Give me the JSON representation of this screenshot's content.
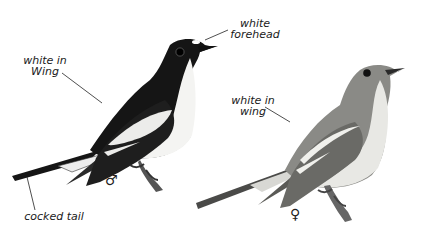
{
  "illustration": {
    "subject": "Pied Flycatcher male and female",
    "background_color": "#ffffff",
    "colors": {
      "male_black": "#151515",
      "male_white": "#f4f4f2",
      "female_grey": "#8a8a86",
      "female_light": "#e8e8e4",
      "ink": "#1a1a1a"
    }
  },
  "labels": {
    "white_forehead": "white\nforehead",
    "male_white_in_wing": "white in\nWing",
    "female_white_in_wing": "white in\nwing",
    "cocked_tail": "cocked tail"
  },
  "symbols": {
    "male": "♂",
    "female": "♀"
  }
}
